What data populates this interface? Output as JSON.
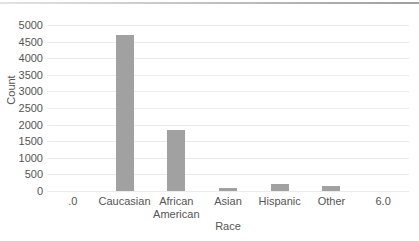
{
  "theme": {
    "background": "#ffffff",
    "text_color": "#555555",
    "bar_color": "#a1a1a1",
    "gridline_color": "#ebebeb",
    "top_border_left_color": "#e3e3e3",
    "top_border_right_color": "#9f9f9f"
  },
  "chart_data": {
    "type": "bar",
    "categories": [
      ".0",
      "Caucasian",
      "African American",
      "Asian",
      "Hispanic",
      "Other",
      "6.0"
    ],
    "values": [
      0,
      4700,
      1850,
      100,
      200,
      150,
      0
    ],
    "xlabel": "Race",
    "ylabel": "Count",
    "ylim": [
      0,
      5000
    ],
    "ytick_step": 500,
    "grid": true,
    "legend_position": "none"
  }
}
